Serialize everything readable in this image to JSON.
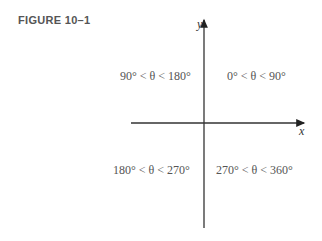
{
  "figure": {
    "label": "FIGURE 10–1",
    "axes": {
      "x_label": "x",
      "y_label": "y"
    },
    "quadrants": {
      "I": "0° < θ < 90°",
      "II": "90° < θ < 180°",
      "III": "180° < θ < 270°",
      "IV": "270° < θ < 360°"
    },
    "colors": {
      "axis": "#333333",
      "text": "#555555"
    }
  }
}
